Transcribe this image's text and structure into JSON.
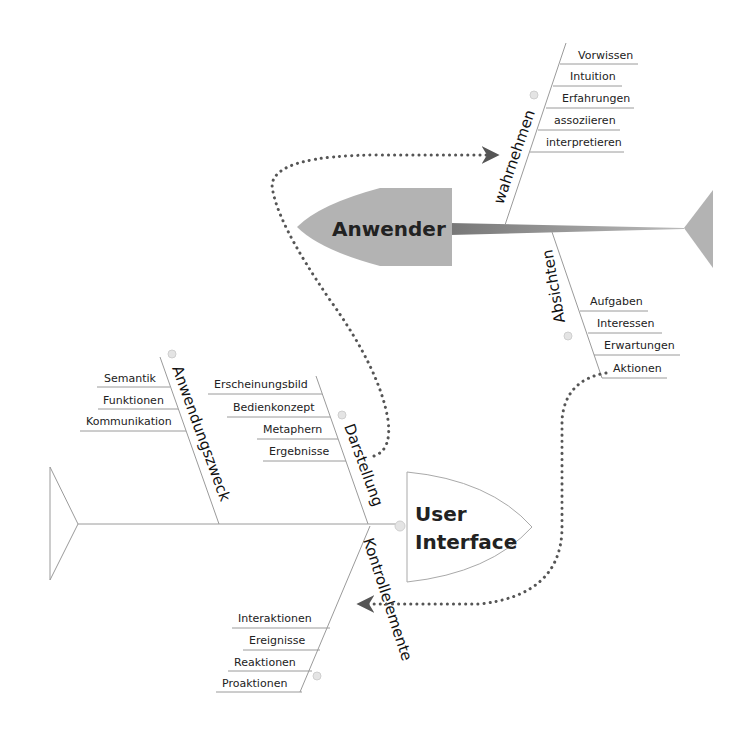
{
  "diagram": {
    "type": "fishbone",
    "colors": {
      "anwender_fill": "#b3b3b3",
      "ui_fill": "#ffffff",
      "line": "#9a9a9a",
      "dotted_connector": "#555555"
    },
    "anwender": {
      "label": "Anwender",
      "branches": {
        "wahrnehmen": {
          "label": "wahrnehmen",
          "items": [
            "Vorwissen",
            "Intuition",
            "Erfahrungen",
            "assoziieren",
            "interpretieren"
          ]
        },
        "absichten": {
          "label": "Absichten",
          "items": [
            "Aufgaben",
            "Interessen",
            "Erwartungen",
            "Aktionen"
          ]
        }
      }
    },
    "user_interface": {
      "label_line1": "User",
      "label_line2": "Interface",
      "branches": {
        "anwendungszweck": {
          "label": "Anwendungszweck",
          "items": [
            "Semantik",
            "Funktionen",
            "Kommunikation"
          ]
        },
        "darstellung": {
          "label": "Darstellung",
          "items": [
            "Erscheinungsbild",
            "Bedienkonzept",
            "Metaphern",
            "Ergebnisse"
          ]
        },
        "kontrollelemente": {
          "label": "Kontrollelemente",
          "items": [
            "Interaktionen",
            "Ereignisse",
            "Reaktionen",
            "Proaktionen"
          ]
        }
      }
    },
    "connectors": [
      {
        "from": "Darstellung",
        "to": "wahrnehmen",
        "style": "dotted-arrow"
      },
      {
        "from": "Aktionen",
        "to": "Kontrollelemente",
        "style": "dotted-arrow"
      }
    ]
  }
}
